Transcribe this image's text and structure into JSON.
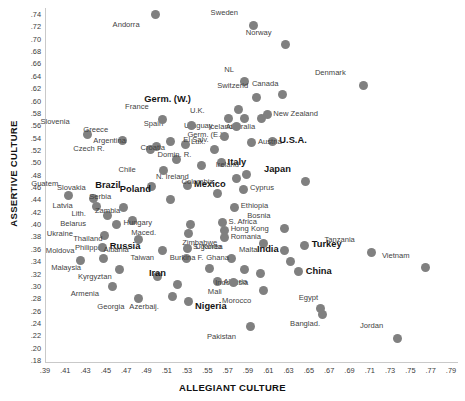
{
  "chart_data": {
    "type": "scatter",
    "title": "",
    "xlabel": "ALLEGIANT CULTURE",
    "ylabel": "ASSERTIVE CULTURE",
    "xlim": [
      0.39,
      0.79
    ],
    "ylim": [
      0.18,
      0.74
    ],
    "xticks": [
      ".39",
      ".41",
      ".43",
      ".45",
      ".47",
      ".49",
      ".51",
      ".53",
      ".55",
      ".57",
      ".59",
      ".61",
      ".63",
      ".65",
      ".67",
      ".69",
      ".71",
      ".73",
      ".75",
      ".77",
      ".79"
    ],
    "yticks": [
      ".74",
      ".72",
      ".70",
      ".68",
      ".66",
      ".64",
      ".62",
      ".60",
      ".58",
      ".56",
      ".54",
      ".52",
      ".50",
      ".48",
      ".46",
      ".44",
      ".42",
      ".40",
      ".38",
      ".36",
      ".34",
      ".32",
      ".30",
      ".28",
      ".26",
      ".24",
      ".22",
      ".20",
      ".18"
    ],
    "grid": false,
    "legend": null,
    "marker_color": "#808080",
    "points": [
      {
        "label": "Andorra",
        "x": 0.498,
        "y": 0.739,
        "lx": -16,
        "ly": 9,
        "bold": false
      },
      {
        "label": "Sweden",
        "x": 0.594,
        "y": 0.722,
        "lx": -15,
        "ly": -13,
        "bold": false
      },
      {
        "label": "Norway",
        "x": 0.626,
        "y": 0.69,
        "lx": -14,
        "ly": -13,
        "bold": false
      },
      {
        "label": "Denmark",
        "x": 0.703,
        "y": 0.625,
        "lx": -18,
        "ly": -13,
        "bold": false
      },
      {
        "label": "NL",
        "x": 0.586,
        "y": 0.63,
        "lx": -11,
        "ly": -13,
        "bold": false
      },
      {
        "label": "Switzerld",
        "x": 0.597,
        "y": 0.605,
        "lx": -8,
        "ly": -12,
        "bold": false
      },
      {
        "label": "Canada",
        "x": 0.623,
        "y": 0.609,
        "lx": -4,
        "ly": -12,
        "bold": false
      },
      {
        "label": "Germ. (W.)",
        "x": 0.58,
        "y": 0.585,
        "lx": -48,
        "ly": -12,
        "bold": true
      },
      {
        "label": "New Zealand",
        "x": 0.608,
        "y": 0.578,
        "lx": 6,
        "ly": -1,
        "bold": false
      },
      {
        "label": "U.K.",
        "x": 0.57,
        "y": 0.571,
        "lx": -24,
        "ly": -8,
        "bold": false
      },
      {
        "label": "Iceland",
        "x": 0.586,
        "y": 0.571,
        "lx": -12,
        "ly": 8,
        "bold": false
      },
      {
        "label": "Australia",
        "x": 0.602,
        "y": 0.571,
        "lx": -6,
        "ly": 8,
        "bold": false
      },
      {
        "label": "Germ. (E.)",
        "x": 0.578,
        "y": 0.558,
        "lx": -14,
        "ly": 8,
        "bold": false
      },
      {
        "label": "U.S.A.",
        "x": 0.613,
        "y": 0.534,
        "lx": 7,
        "ly": -2,
        "bold": true
      },
      {
        "label": "Austria",
        "x": 0.592,
        "y": 0.532,
        "lx": 7,
        "ly": -2,
        "bold": false
      },
      {
        "label": "Uruguay",
        "x": 0.566,
        "y": 0.541,
        "lx": -12,
        "ly": -12,
        "bold": false
      },
      {
        "label": "Spain",
        "x": 0.533,
        "y": 0.56,
        "lx": -28,
        "ly": -2,
        "bold": false
      },
      {
        "label": "France",
        "x": 0.505,
        "y": 0.57,
        "lx": -14,
        "ly": -13,
        "bold": false
      },
      {
        "label": "Slovenia",
        "x": 0.431,
        "y": 0.545,
        "lx": -18,
        "ly": -13,
        "bold": false
      },
      {
        "label": "Greece",
        "x": 0.465,
        "y": 0.535,
        "lx": -14,
        "ly": -12,
        "bold": false
      },
      {
        "label": "Argentina",
        "x": 0.513,
        "y": 0.533,
        "lx": -45,
        "ly": -2,
        "bold": false
      },
      {
        "label": "Lux.",
        "x": 0.527,
        "y": 0.529,
        "lx": 6,
        "ly": -3,
        "bold": false
      },
      {
        "label": "El Salv.",
        "x": 0.556,
        "y": 0.52,
        "lx": -6,
        "ly": -11,
        "bold": false
      },
      {
        "label": "Czech R.",
        "x": 0.493,
        "y": 0.521,
        "lx": -46,
        "ly": -1,
        "bold": false
      },
      {
        "label": "Czech R. 2",
        "x": 0.499,
        "y": 0.526,
        "lx": -999,
        "ly": 0,
        "bold": false
      },
      {
        "label": "Italy",
        "x": 0.563,
        "y": 0.499,
        "lx": 6,
        "ly": -2,
        "bold": true
      },
      {
        "label": "Croatia",
        "x": 0.519,
        "y": 0.505,
        "lx": -12,
        "ly": -12,
        "bold": false
      },
      {
        "label": "Domin. R.",
        "x": 0.543,
        "y": 0.494,
        "lx": -10,
        "ly": -12,
        "bold": false
      },
      {
        "label": "Chile",
        "x": 0.506,
        "y": 0.486,
        "lx": -28,
        "ly": -2,
        "bold": false
      },
      {
        "label": "Ireland",
        "x": 0.588,
        "y": 0.48,
        "lx": -8,
        "ly": -11,
        "bold": false
      },
      {
        "label": "N. Ireland",
        "x": 0.578,
        "y": 0.474,
        "lx": -48,
        "ly": -2,
        "bold": false
      },
      {
        "label": "Japan",
        "x": 0.646,
        "y": 0.469,
        "lx": -15,
        "ly": -13,
        "bold": true
      },
      {
        "label": "Mexico",
        "x": 0.529,
        "y": 0.462,
        "lx": 7,
        "ly": -3,
        "bold": true
      },
      {
        "label": "Brazil",
        "x": 0.494,
        "y": 0.461,
        "lx": -31,
        "ly": -2,
        "bold": true
      },
      {
        "label": "Cyprus",
        "x": 0.585,
        "y": 0.456,
        "lx": 6,
        "ly": -2,
        "bold": false
      },
      {
        "label": "Colombia",
        "x": 0.559,
        "y": 0.45,
        "lx": -4,
        "ly": -12,
        "bold": false
      },
      {
        "label": "Guatem.",
        "x": 0.412,
        "y": 0.447,
        "lx": -8,
        "ly": -12,
        "bold": false
      },
      {
        "label": "Slovakia",
        "x": 0.437,
        "y": 0.442,
        "lx": -8,
        "ly": -11,
        "bold": false
      },
      {
        "label": "Poland",
        "x": 0.513,
        "y": 0.439,
        "lx": -20,
        "ly": -12,
        "bold": true
      },
      {
        "label": "Latvia",
        "x": 0.44,
        "y": 0.428,
        "lx": -24,
        "ly": -2,
        "bold": false
      },
      {
        "label": "Serbia",
        "x": 0.466,
        "y": 0.427,
        "lx": -12,
        "ly": -11,
        "bold": false
      },
      {
        "label": "Ethiopia",
        "x": 0.576,
        "y": 0.427,
        "lx": 6,
        "ly": -2,
        "bold": false
      },
      {
        "label": "Lith.",
        "x": 0.451,
        "y": 0.414,
        "lx": -22,
        "ly": -2,
        "bold": false
      },
      {
        "label": "Zambia",
        "x": 0.475,
        "y": 0.405,
        "lx": -12,
        "ly": -11,
        "bold": false
      },
      {
        "label": "Belarus",
        "x": 0.459,
        "y": 0.399,
        "lx": -30,
        "ly": -2,
        "bold": false
      },
      {
        "label": "Hungary",
        "x": 0.532,
        "y": 0.4,
        "lx": -38,
        "ly": -2,
        "bold": false
      },
      {
        "label": "S. Africa",
        "x": 0.564,
        "y": 0.402,
        "lx": 6,
        "ly": -2,
        "bold": false
      },
      {
        "label": "Hong Kong",
        "x": 0.566,
        "y": 0.39,
        "lx": 6,
        "ly": -2,
        "bold": false
      },
      {
        "label": "Ukraine",
        "x": 0.448,
        "y": 0.382,
        "lx": -32,
        "ly": -2,
        "bold": false
      },
      {
        "label": "Maced.",
        "x": 0.53,
        "y": 0.384,
        "lx": -32,
        "ly": -2,
        "bold": false
      },
      {
        "label": "Romania",
        "x": 0.566,
        "y": 0.378,
        "lx": 6,
        "ly": -2,
        "bold": false
      },
      {
        "label": "Thailand",
        "x": 0.481,
        "y": 0.375,
        "lx": -36,
        "ly": -2,
        "bold": false
      },
      {
        "label": "Bosnia",
        "x": 0.625,
        "y": 0.393,
        "lx": -14,
        "ly": -13,
        "bold": false
      },
      {
        "label": "Russia",
        "x": 0.446,
        "y": 0.362,
        "lx": 7,
        "ly": -3,
        "bold": true
      },
      {
        "label": "Zimbabwe",
        "x": 0.604,
        "y": 0.369,
        "lx": -46,
        "ly": -1,
        "bold": false
      },
      {
        "label": "S. Korea",
        "x": 0.529,
        "y": 0.361,
        "lx": 6,
        "ly": -2,
        "bold": false
      },
      {
        "label": "Albania",
        "x": 0.505,
        "y": 0.357,
        "lx": -34,
        "ly": -2,
        "bold": false
      },
      {
        "label": "Malta",
        "x": 0.625,
        "y": 0.357,
        "lx": -27,
        "ly": -2,
        "bold": false
      },
      {
        "label": "Turkey",
        "x": 0.645,
        "y": 0.366,
        "lx": 7,
        "ly": -2,
        "bold": true
      },
      {
        "label": "Tanzania",
        "x": 0.711,
        "y": 0.354,
        "lx": -17,
        "ly": -13,
        "bold": false
      },
      {
        "label": "Moldova",
        "x": 0.424,
        "y": 0.341,
        "lx": -6,
        "ly": -11,
        "bold": false
      },
      {
        "label": "Philipp.",
        "x": 0.447,
        "y": 0.345,
        "lx": -4,
        "ly": -11,
        "bold": false
      },
      {
        "label": "Taiwan",
        "x": 0.528,
        "y": 0.345,
        "lx": -32,
        "ly": -1,
        "bold": false
      },
      {
        "label": "Uganda",
        "x": 0.573,
        "y": 0.345,
        "lx": -10,
        "ly": -12,
        "bold": false
      },
      {
        "label": "India",
        "x": 0.631,
        "y": 0.34,
        "lx": -12,
        "ly": -13,
        "bold": true
      },
      {
        "label": "Vietnam",
        "x": 0.764,
        "y": 0.329,
        "lx": -16,
        "ly": -13,
        "bold": false
      },
      {
        "label": "Malaysia",
        "x": 0.462,
        "y": 0.327,
        "lx": -38,
        "ly": -2,
        "bold": false
      },
      {
        "label": "Burkina F.",
        "x": 0.551,
        "y": 0.328,
        "lx": -6,
        "ly": -12,
        "bold": false
      },
      {
        "label": "China",
        "x": 0.639,
        "y": 0.323,
        "lx": 7,
        "ly": -2,
        "bold": true
      },
      {
        "label": "Kyrgyztan",
        "x": 0.5,
        "y": 0.315,
        "lx": -46,
        "ly": -1,
        "bold": false
      },
      {
        "label": "Iran",
        "x": 0.52,
        "y": 0.303,
        "lx": -12,
        "ly": -12,
        "bold": true
      },
      {
        "label": "Algeria",
        "x": 0.559,
        "y": 0.307,
        "lx": 6,
        "ly": -1,
        "bold": false
      },
      {
        "label": "Ghana",
        "x": 0.586,
        "y": 0.327,
        "lx": -16,
        "ly": -12,
        "bold": false
      },
      {
        "label": "Indonesia",
        "x": 0.601,
        "y": 0.32,
        "lx": -12,
        "ly": 8,
        "bold": false
      },
      {
        "label": "Armenia",
        "x": 0.456,
        "y": 0.299,
        "lx": -14,
        "ly": 7,
        "bold": false
      },
      {
        "label": "Mali",
        "x": 0.575,
        "y": 0.305,
        "lx": -12,
        "ly": 8,
        "bold": false
      },
      {
        "label": "Georgia",
        "x": 0.481,
        "y": 0.28,
        "lx": -14,
        "ly": 8,
        "bold": false
      },
      {
        "label": "Azerbaij.",
        "x": 0.515,
        "y": 0.282,
        "lx": -14,
        "ly": 9,
        "bold": false
      },
      {
        "label": "Nigeria",
        "x": 0.53,
        "y": 0.275,
        "lx": 7,
        "ly": 4,
        "bold": true
      },
      {
        "label": "Morocco",
        "x": 0.604,
        "y": 0.292,
        "lx": -12,
        "ly": 9,
        "bold": false
      },
      {
        "label": "Egypt",
        "x": 0.66,
        "y": 0.263,
        "lx": -2,
        "ly": -12,
        "bold": false
      },
      {
        "label": "Banglad.",
        "x": 0.662,
        "y": 0.254,
        "lx": -2,
        "ly": 9,
        "bold": false
      },
      {
        "label": "Pakistan",
        "x": 0.591,
        "y": 0.234,
        "lx": -14,
        "ly": 9,
        "bold": false
      },
      {
        "label": "Jordan",
        "x": 0.736,
        "y": 0.215,
        "lx": -14,
        "ly": -13,
        "bold": false
      }
    ]
  }
}
